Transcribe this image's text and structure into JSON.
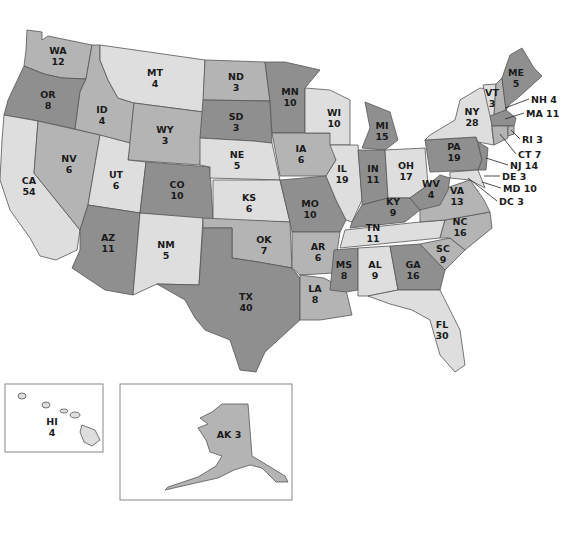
{
  "map": {
    "title_fragment": "",
    "legend_shades": {
      "dark": "#8f8f8f",
      "mid": "#b4b4b4",
      "light": "#dedede"
    },
    "states": [
      {
        "abbr": "WA",
        "votes": "12",
        "shade": "mid",
        "x": 58,
        "y": 56
      },
      {
        "abbr": "OR",
        "votes": "8",
        "shade": "dark",
        "x": 48,
        "y": 100
      },
      {
        "abbr": "CA",
        "votes": "54",
        "shade": "light",
        "x": 29,
        "y": 186
      },
      {
        "abbr": "ID",
        "votes": "4",
        "shade": "mid",
        "x": 102,
        "y": 115
      },
      {
        "abbr": "NV",
        "votes": "6",
        "shade": "mid",
        "x": 69,
        "y": 164
      },
      {
        "abbr": "MT",
        "votes": "4",
        "shade": "light",
        "x": 155,
        "y": 78
      },
      {
        "abbr": "WY",
        "votes": "3",
        "shade": "mid",
        "x": 165,
        "y": 135
      },
      {
        "abbr": "UT",
        "votes": "6",
        "shade": "light",
        "x": 116,
        "y": 180
      },
      {
        "abbr": "CO",
        "votes": "10",
        "shade": "dark",
        "x": 177,
        "y": 190
      },
      {
        "abbr": "AZ",
        "votes": "11",
        "shade": "dark",
        "x": 108,
        "y": 243
      },
      {
        "abbr": "NM",
        "votes": "5",
        "shade": "light",
        "x": 166,
        "y": 250
      },
      {
        "abbr": "ND",
        "votes": "3",
        "shade": "mid",
        "x": 236,
        "y": 82
      },
      {
        "abbr": "SD",
        "votes": "3",
        "shade": "dark",
        "x": 236,
        "y": 122
      },
      {
        "abbr": "NE",
        "votes": "5",
        "shade": "light",
        "x": 237,
        "y": 160
      },
      {
        "abbr": "KS",
        "votes": "6",
        "shade": "light",
        "x": 249,
        "y": 203
      },
      {
        "abbr": "OK",
        "votes": "7",
        "shade": "mid",
        "x": 264,
        "y": 245
      },
      {
        "abbr": "TX",
        "votes": "40",
        "shade": "dark",
        "x": 246,
        "y": 302
      },
      {
        "abbr": "MN",
        "votes": "10",
        "shade": "dark",
        "x": 290,
        "y": 97
      },
      {
        "abbr": "IA",
        "votes": "6",
        "shade": "mid",
        "x": 301,
        "y": 154
      },
      {
        "abbr": "MO",
        "votes": "10",
        "shade": "dark",
        "x": 310,
        "y": 209
      },
      {
        "abbr": "AR",
        "votes": "6",
        "shade": "mid",
        "x": 318,
        "y": 252
      },
      {
        "abbr": "LA",
        "votes": "8",
        "shade": "mid",
        "x": 315,
        "y": 294
      },
      {
        "abbr": "WI",
        "votes": "10",
        "shade": "light",
        "x": 334,
        "y": 118
      },
      {
        "abbr": "IL",
        "votes": "19",
        "shade": "light",
        "x": 342,
        "y": 174
      },
      {
        "abbr": "MI",
        "votes": "15",
        "shade": "dark",
        "x": 382,
        "y": 131
      },
      {
        "abbr": "IN",
        "votes": "11",
        "shade": "dark",
        "x": 373,
        "y": 174
      },
      {
        "abbr": "OH",
        "votes": "17",
        "shade": "light",
        "x": 406,
        "y": 171
      },
      {
        "abbr": "KY",
        "votes": "9",
        "shade": "dark",
        "x": 393,
        "y": 207
      },
      {
        "abbr": "TN",
        "votes": "11",
        "shade": "light",
        "x": 373,
        "y": 233
      },
      {
        "abbr": "MS",
        "votes": "8",
        "shade": "dark",
        "x": 344,
        "y": 270
      },
      {
        "abbr": "AL",
        "votes": "9",
        "shade": "light",
        "x": 375,
        "y": 270
      },
      {
        "abbr": "GA",
        "votes": "16",
        "shade": "dark",
        "x": 413,
        "y": 270
      },
      {
        "abbr": "FL",
        "votes": "30",
        "shade": "light",
        "x": 442,
        "y": 330
      },
      {
        "abbr": "SC",
        "votes": "9",
        "shade": "mid",
        "x": 443,
        "y": 254
      },
      {
        "abbr": "NC",
        "votes": "16",
        "shade": "mid",
        "x": 460,
        "y": 227
      },
      {
        "abbr": "VA",
        "votes": "13",
        "shade": "mid",
        "x": 457,
        "y": 196
      },
      {
        "abbr": "WV",
        "votes": "4",
        "shade": "dark",
        "x": 431,
        "y": 189
      },
      {
        "abbr": "PA",
        "votes": "19",
        "shade": "dark",
        "x": 454,
        "y": 152
      },
      {
        "abbr": "NY",
        "votes": "28",
        "shade": "light",
        "x": 472,
        "y": 117
      },
      {
        "abbr": "VT",
        "votes": "3",
        "shade": "light",
        "x": 492,
        "y": 98
      },
      {
        "abbr": "ME",
        "votes": "5",
        "shade": "dark",
        "x": 516,
        "y": 78
      },
      {
        "abbr": "HI",
        "votes": "4",
        "shade": "light",
        "x": 52,
        "y": 427
      },
      {
        "abbr": "AK",
        "votes": "3",
        "shade": "mid",
        "x": 229,
        "y": 434
      }
    ],
    "callouts": [
      {
        "label": "NH 4",
        "x": 531,
        "y": 99
      },
      {
        "label": "MA 11",
        "x": 526,
        "y": 113
      },
      {
        "label": "RI 3",
        "x": 522,
        "y": 139
      },
      {
        "label": "CT 7",
        "x": 518,
        "y": 154
      },
      {
        "label": "NJ 14",
        "x": 510,
        "y": 165
      },
      {
        "label": "DE 3",
        "x": 502,
        "y": 176
      },
      {
        "label": "MD 10",
        "x": 503,
        "y": 188
      },
      {
        "label": "DC 3",
        "x": 499,
        "y": 201
      }
    ]
  }
}
